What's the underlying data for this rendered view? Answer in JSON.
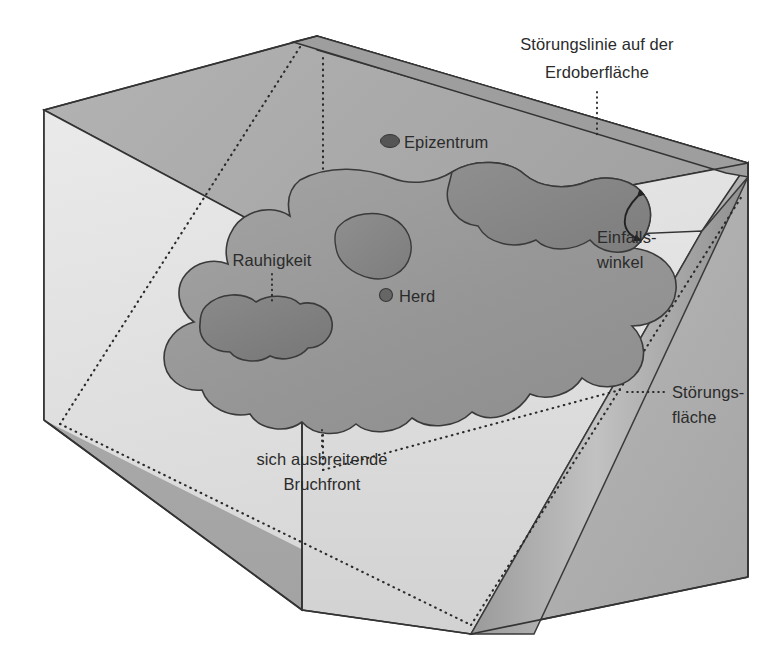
{
  "figure": {
    "language": "de"
  },
  "labels": {
    "fault_line_surface": "Störungslinie auf der\nErdoberfläche",
    "fault_line_surface_l1": "Störungslinie auf der",
    "fault_line_surface_l2": "Erdoberfläche",
    "epicenter": "Epizentrum",
    "dip_angle_l1": "Einfalls-",
    "dip_angle_l2": "winkel",
    "fault_plane_l1": "Störungs-",
    "fault_plane_l2": "fläche",
    "roughness": "Rauhigkeit",
    "hypocenter": "Herd",
    "rupture_front_l1": "sich ausbreitende",
    "rupture_front_l2": "Bruchfront"
  },
  "markers": {
    "epicenter_dot": "epicenter-dot",
    "hypocenter_dot": "hypocenter-dot"
  },
  "colors": {
    "background": "#ffffff",
    "top_surface": "#ababab",
    "left_face": "#a9a9a9",
    "fault_plane_light": "#e3e3e3",
    "fault_plane_band": "#b4b4b4",
    "right_face": "#b0b0b0",
    "front_face": "#dcdcdc",
    "rupture_blob": "#9a9a9a",
    "rupture_blob_dark": "#8a8a8a",
    "roughness_patch": "#828282",
    "stroke": "#333333",
    "text": "#2b2b2b"
  },
  "icons": {
    "dip_arc": "curved-double-arrow-icon"
  }
}
